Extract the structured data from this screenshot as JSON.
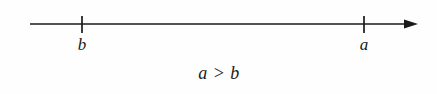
{
  "figure": {
    "type": "number-line-diagram",
    "width": 437,
    "height": 94,
    "background_color": "#fefefe",
    "ink_color": "#1a1a1a"
  },
  "number_line": {
    "line": {
      "x_start": 30,
      "x_end": 418,
      "y": 24,
      "stroke_width": 1.6
    },
    "arrow": {
      "direction": "right",
      "tip_x": 418,
      "head_length": 13,
      "head_half_width": 4.5
    }
  },
  "ticks": [
    {
      "id": "tick-b",
      "label": "b",
      "x": 82,
      "top_y": 16,
      "bottom_y": 33,
      "label_x": 82,
      "label_y": 36
    },
    {
      "id": "tick-a",
      "label": "a",
      "x": 364,
      "top_y": 16,
      "bottom_y": 33,
      "label_x": 364,
      "label_y": 36
    }
  ],
  "caption": {
    "text": "a > b",
    "x": 219,
    "y": 64
  }
}
